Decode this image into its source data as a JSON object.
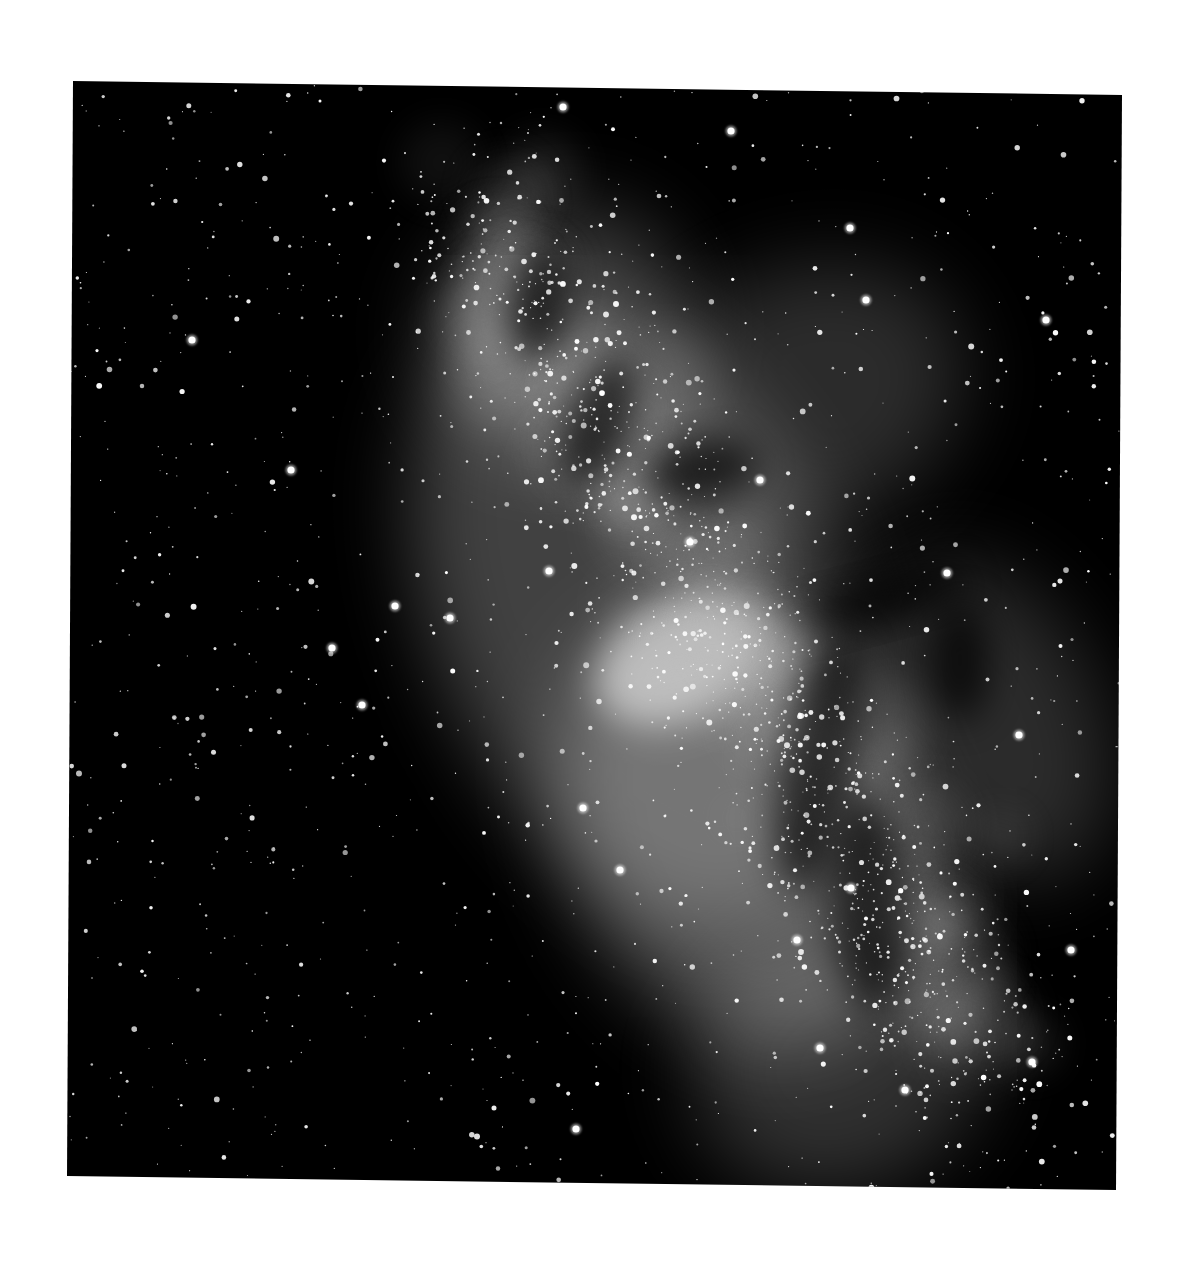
{
  "image": {
    "subject": "Milky Way galactic center star field",
    "style": "black-and-white astrophotograph",
    "background_color": "#ffffff",
    "frame_color": "#000000",
    "frame_corners": {
      "top_left": [
        73,
        81
      ],
      "top_right": [
        1122,
        95
      ],
      "bottom_right": [
        1116,
        1190
      ],
      "bottom_left": [
        67,
        1176
      ]
    },
    "nebula_regions": [
      {
        "name": "galactic-core-bright-cloud",
        "cx": 680,
        "cy": 660,
        "rx": 90,
        "ry": 60,
        "opacity": 0.75
      },
      {
        "name": "lower-star-cloud",
        "cx": 740,
        "cy": 830,
        "rx": 170,
        "ry": 230,
        "opacity": 0.35
      },
      {
        "name": "central-band",
        "cx": 640,
        "cy": 620,
        "rx": 200,
        "ry": 330,
        "opacity": 0.3
      },
      {
        "name": "upper-cloud",
        "cx": 560,
        "cy": 330,
        "rx": 130,
        "ry": 120,
        "opacity": 0.28
      },
      {
        "name": "upper-right-cloud",
        "cx": 800,
        "cy": 400,
        "rx": 170,
        "ry": 130,
        "opacity": 0.2
      },
      {
        "name": "right-cloud",
        "cx": 990,
        "cy": 720,
        "rx": 110,
        "ry": 170,
        "opacity": 0.2
      },
      {
        "name": "bottom-cloud",
        "cx": 840,
        "cy": 1060,
        "rx": 150,
        "ry": 130,
        "opacity": 0.22
      }
    ],
    "bright_stars": [
      [
        731,
        131
      ],
      [
        563,
        107
      ],
      [
        1046,
        320
      ],
      [
        866,
        300
      ],
      [
        291,
        470
      ],
      [
        395,
        606
      ],
      [
        450,
        618
      ],
      [
        362,
        705
      ],
      [
        583,
        808
      ],
      [
        620,
        870
      ],
      [
        851,
        888
      ],
      [
        797,
        940
      ],
      [
        820,
        1048
      ],
      [
        1071,
        950
      ],
      [
        1032,
        1062
      ],
      [
        576,
        1129
      ],
      [
        690,
        542
      ],
      [
        549,
        571
      ],
      [
        947,
        573
      ],
      [
        1019,
        735
      ],
      [
        332,
        648
      ],
      [
        192,
        340
      ],
      [
        905,
        1090
      ],
      [
        850,
        228
      ],
      [
        760,
        480
      ]
    ],
    "star_count": 2600,
    "text_visible": "none"
  }
}
